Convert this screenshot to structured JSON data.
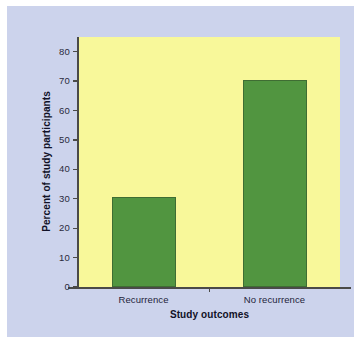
{
  "figure": {
    "background_color": "#ccd3ec",
    "plot_background_color": "#f8f89a",
    "bar_color": "#519540",
    "bar_edge_color": "#3f6d33",
    "axis_color": "#4a4a48"
  },
  "chart_data": {
    "type": "bar",
    "title": "",
    "categories": [
      "Recurrence",
      "No recurrence"
    ],
    "values": [
      30.5,
      70.5
    ],
    "xlabel": "Study outcomes",
    "ylabel": "Percent of study participants",
    "ylim": [
      0,
      85
    ],
    "yticks": [
      0,
      10,
      20,
      30,
      40,
      50,
      60,
      70,
      80
    ],
    "ytick_labels": [
      "0",
      "10",
      "20",
      "30",
      "40",
      "50",
      "60",
      "70",
      "80"
    ],
    "grid": false,
    "legend": null
  }
}
